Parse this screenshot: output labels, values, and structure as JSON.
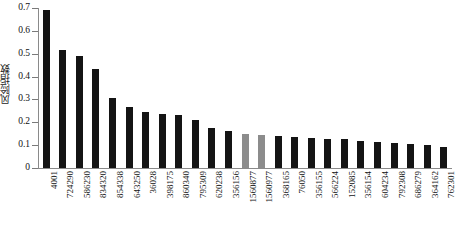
{
  "chart_data": {
    "type": "bar",
    "title": "",
    "xlabel": "",
    "ylabel": "风险指数",
    "ylim": [
      0,
      0.7
    ],
    "yticks": [
      "0",
      "0.1",
      "0.2",
      "0.3",
      "0.4",
      "0.5",
      "0.6",
      "0.7"
    ],
    "ytick_values": [
      0,
      0.1,
      0.2,
      0.3,
      0.4,
      0.5,
      0.6,
      0.7
    ],
    "grid": false,
    "legend": "none",
    "bar_color_primary": "#141414",
    "bar_color_highlight": "#8c8c8c",
    "axis_color": "#8a8a8a",
    "background": "#ffffff",
    "categories": [
      "4001",
      "724290",
      "586230",
      "834320",
      "854338",
      "643250",
      "36028",
      "398175",
      "860340",
      "795309",
      "620238",
      "356156",
      "1560877",
      "1560977",
      "368165",
      "76050",
      "356155",
      "566224",
      "152085",
      "356154",
      "604234",
      "792308",
      "686279",
      "364162",
      "762301"
    ],
    "values": [
      0.69,
      0.515,
      0.49,
      0.435,
      0.305,
      0.265,
      0.245,
      0.235,
      0.23,
      0.21,
      0.175,
      0.16,
      0.15,
      0.145,
      0.14,
      0.135,
      0.13,
      0.128,
      0.125,
      0.12,
      0.115,
      0.11,
      0.105,
      0.1,
      0.09
    ],
    "highlighted_categories": [
      "1560877",
      "1560977"
    ],
    "highlighted_indices": [
      12,
      13
    ]
  }
}
